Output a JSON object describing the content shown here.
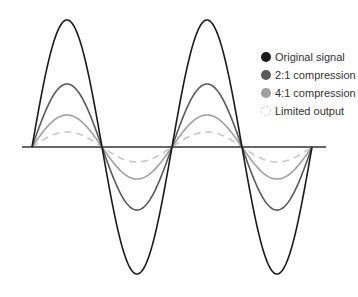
{
  "chart_data": {
    "type": "line",
    "title": "",
    "xlabel": "",
    "ylabel": "",
    "grid": false,
    "legend_position": "right",
    "x_axis": {
      "x_start": 22,
      "x_end": 326,
      "y": 147
    },
    "wave": {
      "x0": 32,
      "half_period_px": 70,
      "cycles": 2.0,
      "baseline_y": 147
    },
    "series": [
      {
        "name": "Original signal",
        "amplitude": 127,
        "color": "#1a1a1a",
        "style": "solid",
        "width": 1.6
      },
      {
        "name": "2:1 compression",
        "amplitude": 63,
        "color": "#5a5a5a",
        "style": "solid",
        "width": 1.6
      },
      {
        "name": "4:1 compression",
        "amplitude": 32,
        "color": "#a0a0a0",
        "style": "solid",
        "width": 1.6
      },
      {
        "name": "Limited output",
        "amplitude": 15,
        "color": "#c8c8c8",
        "style": "dashed",
        "width": 1.6
      }
    ]
  },
  "legend": {
    "items": [
      {
        "label": "Original signal",
        "color": "#1a1a1a",
        "dashed": false
      },
      {
        "label": "2:1 compression",
        "color": "#5a5a5a",
        "dashed": false
      },
      {
        "label": "4:1 compression",
        "color": "#a0a0a0",
        "dashed": false
      },
      {
        "label": "Limited output",
        "color": "#c8c8c8",
        "dashed": true
      }
    ]
  }
}
